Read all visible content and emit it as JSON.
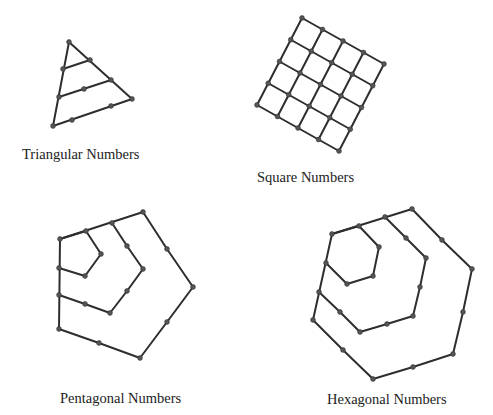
{
  "figures": {
    "triangular": {
      "label": "Triangular Numbers",
      "label_pos": [
        22,
        159
      ],
      "polylines": [
        [
          [
            69,
            42
          ],
          [
            53,
            126
          ],
          [
            132,
            99
          ],
          [
            69,
            42
          ]
        ],
        [
          [
            63,
            69
          ],
          [
            90,
            60
          ]
        ],
        [
          [
            59,
            97
          ],
          [
            111,
            80
          ]
        ]
      ],
      "dots": [
        [
          69,
          42
        ],
        [
          63,
          69
        ],
        [
          90,
          60
        ],
        [
          59,
          97
        ],
        [
          84,
          89
        ],
        [
          111,
          80
        ],
        [
          53,
          126
        ],
        [
          72,
          120
        ],
        [
          111,
          106
        ],
        [
          132,
          99
        ]
      ]
    },
    "square": {
      "label": "Square Numbers",
      "label_pos": [
        257,
        182
      ],
      "origin": [
        302,
        18
      ],
      "row_step": [
        20.5,
        11.5
      ],
      "col_step": [
        -11.25,
        21.75
      ],
      "size": 5
    },
    "pentagonal": {
      "label": "Pentagonal Numbers",
      "label_pos": [
        60,
        403
      ],
      "polylines": [
        [
          [
            60,
            239
          ],
          [
            86,
            231
          ],
          [
            101,
            254
          ],
          [
            85,
            276
          ],
          [
            59,
            268
          ]
        ],
        [
          [
            112,
            223
          ],
          [
            127,
            246
          ],
          [
            143,
            269
          ],
          [
            127,
            291
          ],
          [
            110,
            313
          ],
          [
            85,
            304
          ],
          [
            59,
            295
          ]
        ],
        [
          [
            60,
            239
          ],
          [
            143,
            212
          ],
          [
            167,
            249
          ],
          [
            193,
            287
          ],
          [
            167,
            322
          ],
          [
            140,
            358
          ],
          [
            99,
            343
          ],
          [
            59,
            329
          ],
          [
            60,
            239
          ]
        ]
      ],
      "dots": [
        [
          60,
          239
        ],
        [
          86,
          231
        ],
        [
          112,
          223
        ],
        [
          143,
          212
        ],
        [
          101,
          254
        ],
        [
          85,
          276
        ],
        [
          59,
          268
        ],
        [
          127,
          246
        ],
        [
          143,
          269
        ],
        [
          127,
          291
        ],
        [
          110,
          313
        ],
        [
          85,
          304
        ],
        [
          59,
          295
        ],
        [
          167,
          249
        ],
        [
          193,
          287
        ],
        [
          167,
          322
        ],
        [
          140,
          358
        ],
        [
          99,
          343
        ],
        [
          59,
          329
        ]
      ]
    },
    "hexagonal": {
      "label": "Hexagonal Numbers",
      "label_pos": [
        327,
        404
      ],
      "polylines": [
        [
          [
            332,
            234
          ],
          [
            359,
            226
          ],
          [
            379,
            247
          ],
          [
            373,
            276
          ],
          [
            347,
            284
          ],
          [
            326,
            263
          ]
        ],
        [
          [
            385,
            217
          ],
          [
            406,
            238
          ],
          [
            426,
            258
          ],
          [
            420,
            287
          ],
          [
            413,
            316
          ],
          [
            387,
            324
          ],
          [
            360,
            332
          ],
          [
            340,
            312
          ],
          [
            319,
            292
          ]
        ],
        [
          [
            332,
            234
          ],
          [
            412,
            209
          ],
          [
            442,
            240
          ],
          [
            472,
            269
          ],
          [
            463,
            312
          ],
          [
            453,
            354
          ],
          [
            413,
            367
          ],
          [
            373,
            379
          ],
          [
            343,
            350
          ],
          [
            313,
            320
          ],
          [
            332,
            234
          ]
        ]
      ],
      "dots": [
        [
          332,
          234
        ],
        [
          359,
          226
        ],
        [
          385,
          217
        ],
        [
          412,
          209
        ],
        [
          379,
          247
        ],
        [
          373,
          276
        ],
        [
          347,
          284
        ],
        [
          326,
          263
        ],
        [
          406,
          238
        ],
        [
          426,
          258
        ],
        [
          420,
          287
        ],
        [
          413,
          316
        ],
        [
          387,
          324
        ],
        [
          360,
          332
        ],
        [
          340,
          312
        ],
        [
          319,
          292
        ],
        [
          442,
          240
        ],
        [
          472,
          269
        ],
        [
          463,
          312
        ],
        [
          453,
          354
        ],
        [
          413,
          367
        ],
        [
          373,
          379
        ],
        [
          343,
          350
        ],
        [
          313,
          320
        ]
      ]
    }
  }
}
